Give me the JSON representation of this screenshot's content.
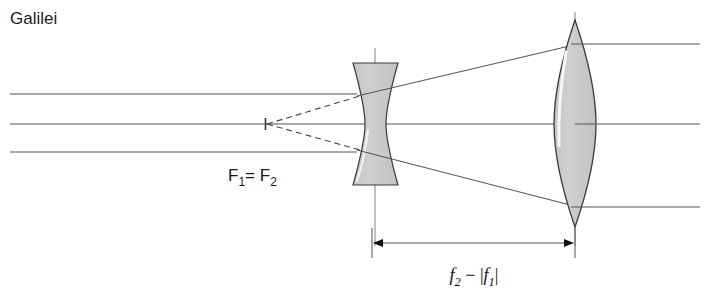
{
  "figure": {
    "title": "Galilei",
    "type": "optical-ray-diagram",
    "background_color": "#ffffff",
    "ray_color": "#555555",
    "outline_color": "#3a3a3a",
    "glass_fill": "#c9c9c9",
    "text_color": "#1a1a1a"
  },
  "labels": {
    "title": "Galilei",
    "focal_point": {
      "f1": "F",
      "f1_sub": "1",
      "equals": "= ",
      "f2": "F",
      "f2_sub": "2",
      "full_text": "F1= F2"
    },
    "dimension": {
      "f2": "f",
      "f2_sub": "2",
      "minus": " − ",
      "abs_open": "|",
      "f1": "f",
      "f1_sub": "1",
      "abs_close": "|",
      "full_text": "f2 − |f1|"
    }
  },
  "optics": {
    "optical_axis_y": 124,
    "concave_lens": {
      "name": "diverging-lens",
      "center_x": 375,
      "left_x": 353,
      "right_x": 398,
      "top_y": 63,
      "bottom_y": 185,
      "waist_half_width": 7,
      "axis_line_top": 48,
      "axis_line_bottom": 246
    },
    "convex_lens": {
      "name": "converging-lens",
      "center_x": 575,
      "half_width": 20,
      "top_y": 20,
      "bottom_y": 227,
      "axis_line_top": 12,
      "axis_line_bottom": 246
    },
    "virtual_focus": {
      "x": 265,
      "y": 124,
      "tick_half_height": 6
    },
    "incoming_rays": [
      {
        "y": 94,
        "start_x": 10,
        "end_x": 357
      },
      {
        "y": 124,
        "start_x": 10,
        "end_x": 575
      },
      {
        "y": 152,
        "start_x": 10,
        "end_x": 357
      }
    ],
    "outgoing_rays": [
      {
        "y": 44,
        "start_x": 572,
        "end_x": 700
      },
      {
        "y": 124,
        "start_x": 575,
        "end_x": 700
      },
      {
        "y": 206,
        "start_x": 572,
        "end_x": 700
      }
    ],
    "diverging_rays": [
      {
        "x1": 358,
        "y1": 96,
        "x2": 578,
        "y2": 44
      },
      {
        "x1": 358,
        "y1": 150,
        "x2": 578,
        "y2": 207
      }
    ],
    "dashed_construction": [
      {
        "x1": 266,
        "y1": 124,
        "x2": 360,
        "y2": 96
      },
      {
        "x1": 266,
        "y1": 124,
        "x2": 360,
        "y2": 150
      }
    ]
  },
  "dimension_line": {
    "y": 243,
    "left_x": 372,
    "right_x": 575,
    "extension_top": 228,
    "extension_bottom": 258,
    "arrow_size": 9,
    "label_x": 474,
    "label_y": 280
  }
}
